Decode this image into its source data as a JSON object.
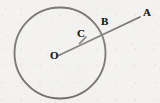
{
  "figure": {
    "kind": "geometry-diagram",
    "width": 160,
    "height": 103,
    "background_color": "#f2f1ef",
    "ink_color": "#2b2a29",
    "stroke_width": 1.9
  },
  "circle": {
    "name": "main-circle",
    "center_x": 60,
    "center_y": 53,
    "radius": 45.5,
    "stroke_color": "#2b2a29",
    "stroke_width": 1.9,
    "fill": "none"
  },
  "ray": {
    "name": "ray-OA",
    "from_x": 57.5,
    "from_y": 56.0,
    "to_x": 140.0,
    "to_y": 17.0,
    "stroke_color": "#2b2a29",
    "stroke_width": 1.9
  },
  "tick": {
    "name": "point-c-tick",
    "x1": 86.0,
    "y1": 37.0,
    "x2": 79.5,
    "y2": 43.5,
    "stroke_color": "#2b2a29",
    "stroke_width": 1.7
  },
  "labels": {
    "center": "O",
    "interior_point": "C",
    "circle_point": "B",
    "outer_point": "A"
  },
  "points": [
    {
      "id": "O",
      "label": "O",
      "role": "circle-center",
      "x": 57.5,
      "y": 56.0
    },
    {
      "id": "C",
      "label": "C",
      "role": "interior-point",
      "x": 85.0,
      "y": 43.0
    },
    {
      "id": "B",
      "label": "B",
      "role": "circle-intersection",
      "x": 104.0,
      "y": 27.0
    },
    {
      "id": "A",
      "label": "A",
      "role": "exterior-endpoint",
      "x": 140.0,
      "y": 17.0
    }
  ]
}
